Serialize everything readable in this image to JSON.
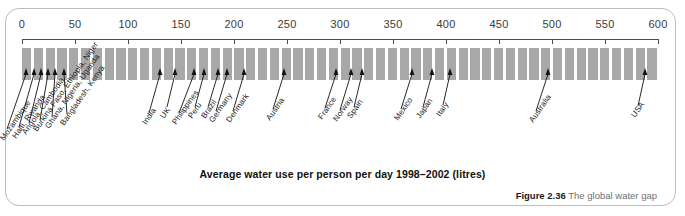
{
  "figure": {
    "number_label": "Figure 2.36",
    "caption": "The global water gap",
    "axis_title": "Average water use per person per day 1998–2002 (litres)"
  },
  "chart_data": {
    "type": "bar",
    "title": "Average water use per person per day 1998–2002 (litres)",
    "xlabel": "Average water use per person per day 1998–2002 (litres)",
    "ylabel": "",
    "xlim": [
      0,
      600
    ],
    "xticks": [
      0,
      50,
      100,
      150,
      200,
      250,
      300,
      350,
      400,
      450,
      500,
      550,
      600
    ],
    "xtick_labels": [
      "0",
      "50",
      "100",
      "150",
      "200",
      "250",
      "300",
      "350",
      "400",
      "450",
      "500",
      "550",
      "600"
    ],
    "grid": false,
    "legend": "none",
    "orientation": "horizontal-scale",
    "annotation_style": "arrow markers on a striped scale bar",
    "categories": [
      "Mozambique",
      "Haiti, Rwanda",
      "Angola, Cambodia",
      "Burkina Faso, Ethiopia, Niger",
      "Ghana, Nigeria, Uganda",
      "Bangladesh, Kenya",
      "India",
      "UK",
      "Philippines",
      "Peru",
      "Brazil",
      "Germany",
      "Denmark",
      "Austria",
      "France",
      "Norway",
      "Spain",
      "Mexico",
      "Japan",
      "Italy",
      "Australia",
      "USA"
    ],
    "values": [
      4,
      11,
      15,
      21,
      28,
      36,
      130,
      144,
      162,
      172,
      185,
      193,
      209,
      247,
      296,
      310,
      320,
      368,
      387,
      404,
      496,
      588
    ]
  },
  "markers": [
    {
      "label": "Mozambique",
      "value": 4,
      "x_px": 26,
      "label_x_px": 2,
      "label_y_px": 135
    },
    {
      "label": "Haiti, Rwanda",
      "value": 11,
      "x_px": 34,
      "label_x_px": 14,
      "label_y_px": 133
    },
    {
      "label": "Angola, Cambodia",
      "value": 15,
      "x_px": 41,
      "label_x_px": 24,
      "label_y_px": 129
    },
    {
      "label": "Burkina Faso, Ethiopia, Niger",
      "value": 21,
      "x_px": 48,
      "label_x_px": 35,
      "label_y_px": 126
    },
    {
      "label": "Ghana, Nigeria, Uganda",
      "value": 28,
      "x_px": 55,
      "label_x_px": 47,
      "label_y_px": 123
    },
    {
      "label": "Bangladesh, Kenya",
      "value": 36,
      "x_px": 64,
      "label_x_px": 62,
      "label_y_px": 120
    },
    {
      "label": "India",
      "value": 130,
      "x_px": 160,
      "label_x_px": 144,
      "label_y_px": 119
    },
    {
      "label": "UK",
      "value": 144,
      "x_px": 175,
      "label_x_px": 162,
      "label_y_px": 113
    },
    {
      "label": "Philippines",
      "value": 162,
      "x_px": 194,
      "label_x_px": 174,
      "label_y_px": 119
    },
    {
      "label": "Peru",
      "value": 172,
      "x_px": 204,
      "label_x_px": 190,
      "label_y_px": 113
    },
    {
      "label": "Brazil",
      "value": 185,
      "x_px": 218,
      "label_x_px": 203,
      "label_y_px": 113
    },
    {
      "label": "Germany",
      "value": 193,
      "x_px": 227,
      "label_x_px": 211,
      "label_y_px": 117
    },
    {
      "label": "Denmark",
      "value": 209,
      "x_px": 244,
      "label_x_px": 228,
      "label_y_px": 117
    },
    {
      "label": "Austria",
      "value": 247,
      "x_px": 284,
      "label_x_px": 268,
      "label_y_px": 115
    },
    {
      "label": "France",
      "value": 296,
      "x_px": 336,
      "label_x_px": 320,
      "label_y_px": 114
    },
    {
      "label": "Norway",
      "value": 310,
      "x_px": 351,
      "label_x_px": 335,
      "label_y_px": 116
    },
    {
      "label": "Spain",
      "value": 320,
      "x_px": 362,
      "label_x_px": 349,
      "label_y_px": 113
    },
    {
      "label": "Mexico",
      "value": 368,
      "x_px": 412,
      "label_x_px": 396,
      "label_y_px": 115
    },
    {
      "label": "Japan",
      "value": 387,
      "x_px": 432,
      "label_x_px": 418,
      "label_y_px": 113
    },
    {
      "label": "Italy",
      "value": 404,
      "x_px": 450,
      "label_x_px": 438,
      "label_y_px": 111
    },
    {
      "label": "Australia",
      "value": 496,
      "x_px": 548,
      "label_x_px": 531,
      "label_y_px": 117
    },
    {
      "label": "USA",
      "value": 588,
      "x_px": 645,
      "label_x_px": 633,
      "label_y_px": 112
    }
  ],
  "style": {
    "stripe_color": "#a8a8a8",
    "axis_color": "#4c4c4c",
    "frame_color": "#b9bcc0",
    "text_color": "#1c1c1c",
    "caption_color": "#6d7176"
  }
}
